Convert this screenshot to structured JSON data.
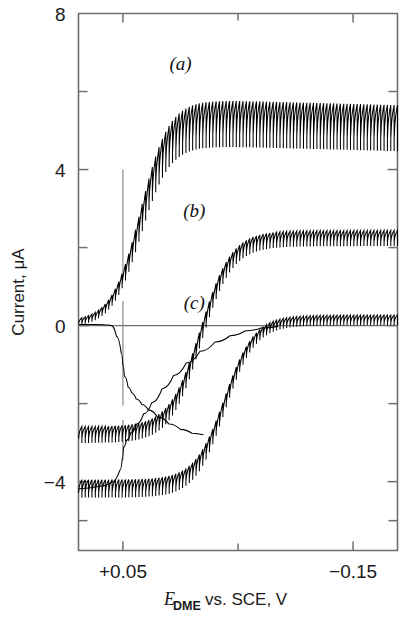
{
  "figure": {
    "kind": "polarogram",
    "background_color": "#ffffff",
    "ink_color": "#000000",
    "frame_color": "#6f6f6f"
  },
  "chart_data": {
    "type": "line",
    "title": "",
    "subtitle": "",
    "xlabel": "E_DME vs. SCE, V",
    "xlabel_parts": {
      "symbol": "E",
      "subscript": "DME",
      "rest": "vs.  SCE,  V"
    },
    "ylabel": "Current,  μA",
    "xlim": [
      0.0886,
      -0.1886
    ],
    "ylim": [
      -5.765,
      8.0
    ],
    "x_direction": "decreasing-left-to-right",
    "grid": false,
    "legend_position": "inline-annotations",
    "x_major_ticks": [
      0.05,
      -0.15
    ],
    "x_major_tick_labels": [
      "+0.05",
      "−0.15"
    ],
    "x_minor_ticks": [
      -0.05
    ],
    "y_major_ticks": [
      8,
      4,
      0,
      -4
    ],
    "y_major_tick_labels": [
      "8",
      "4",
      "0",
      "−4"
    ],
    "y_minor_ticks": [
      6,
      2,
      -2
    ],
    "annotations": [
      {
        "text": "(a)",
        "x": 0.0,
        "y": 6.55,
        "series": "a"
      },
      {
        "text": "(b)",
        "x": -0.012,
        "y": 2.78,
        "series": "b"
      },
      {
        "text": "(c)",
        "x": -0.012,
        "y": 0.42,
        "series": "c"
      }
    ],
    "zero_line": {
      "y": 0,
      "x_from": 0.0886,
      "x_to": -0.1886
    },
    "marker_lines": [
      {
        "x": 0.05,
        "y_from": 4.0,
        "y_to": 1.35,
        "label": "half-wave-marker-a"
      },
      {
        "x": 0.05,
        "y_from": 0.63,
        "y_to": -2.05,
        "label": "half-wave-marker-b"
      },
      {
        "x": 0.05,
        "y_from": -2.42,
        "y_to": -3.45,
        "label": "half-wave-marker-c"
      }
    ],
    "oscillation": {
      "description": "dropping-mercury-electrode drop oscillations (sawtooth)",
      "period_volts": 0.00292,
      "drop_count": 95
    },
    "series": [
      {
        "name": "a",
        "label": "(a)",
        "baseline_start": 0.03,
        "plateau": 5.28,
        "half_wave_potential": 0.0345,
        "wave_slope": 0.0255,
        "osc_amplitude_base": 0.16,
        "osc_amplitude_plateau": 1.18,
        "plateau_tilt": -0.22
      },
      {
        "name": "b",
        "label": "(b)",
        "baseline_start": -2.8,
        "plateau": 2.22,
        "half_wave_potential": -0.0175,
        "wave_slope": 0.0275,
        "osc_amplitude_base": 0.42,
        "osc_amplitude_plateau": 0.4,
        "plateau_tilt": 0.02
      },
      {
        "name": "c",
        "label": "(c)",
        "baseline_start": -4.18,
        "plateau": 0.13,
        "half_wave_potential": -0.0385,
        "wave_slope": 0.0265,
        "osc_amplitude_base": 0.46,
        "osc_amplitude_plateau": 0.26,
        "plateau_tilt": 0.01
      },
      {
        "name": "residual-a",
        "label": "",
        "baseline_start": 0.0,
        "plateau": 0.0,
        "note": "smooth descending residual branch crossing zero near +0.05 V",
        "smooth": true
      }
    ],
    "smooth_branches": [
      {
        "name": "smooth-branch-upper",
        "note": "smooth curve descending from the (a) base through zero to the (b) plateau foot",
        "points": [
          [
            0.0886,
            0.03
          ],
          [
            0.075,
            0.03
          ],
          [
            0.066,
            0.02
          ],
          [
            0.06,
            0.0
          ],
          [
            0.0555,
            -0.28
          ],
          [
            0.0515,
            -0.7
          ],
          [
            0.05,
            -1.02
          ],
          [
            0.0487,
            -1.3
          ],
          [
            0.0455,
            -1.58
          ],
          [
            0.0425,
            -1.72
          ],
          [
            0.0385,
            -1.88
          ],
          [
            0.0335,
            -2.02
          ],
          [
            0.028,
            -2.16
          ],
          [
            0.02,
            -2.34
          ],
          [
            0.01,
            -2.52
          ],
          [
            0.0,
            -2.66
          ],
          [
            -0.01,
            -2.76
          ],
          [
            -0.02,
            -2.8
          ]
        ]
      },
      {
        "name": "smooth-branch-lower",
        "note": "smooth curve rising from below -4 through -3 to the (c) plateau foot",
        "points": [
          [
            0.0886,
            -4.18
          ],
          [
            0.07,
            -4.12
          ],
          [
            0.06,
            -4.02
          ],
          [
            0.0525,
            -3.7
          ],
          [
            0.0505,
            -3.4
          ],
          [
            0.0495,
            -3.12
          ],
          [
            0.047,
            -2.94
          ],
          [
            0.043,
            -2.74
          ],
          [
            0.038,
            -2.52
          ],
          [
            0.032,
            -2.26
          ],
          [
            0.025,
            -1.98
          ],
          [
            0.016,
            -1.62
          ],
          [
            0.006,
            -1.28
          ],
          [
            -0.005,
            -0.96
          ],
          [
            -0.017,
            -0.66
          ],
          [
            -0.03,
            -0.42
          ],
          [
            -0.043,
            -0.26
          ],
          [
            -0.056,
            -0.14
          ],
          [
            -0.07,
            -0.06
          ],
          [
            -0.085,
            -0.02
          ]
        ]
      }
    ]
  }
}
